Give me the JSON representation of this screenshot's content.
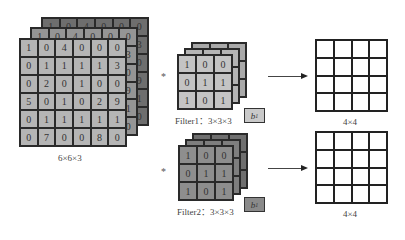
{
  "colors": {
    "input_back": "#6e6e6e",
    "input_mid": "#959595",
    "input_front": "#b5b5b5",
    "filter1_back": "#a9a9a9",
    "filter1_front": "#c4c4c4",
    "filter2_back": "#6f6f6f",
    "filter2_front": "#8e8e8e",
    "bias1_fill": "#c9c9c9",
    "bias2_fill": "#8a8a8a"
  },
  "input": {
    "label": "6×6×3",
    "back_layer_top_row": [
      "1",
      "0",
      "4",
      "0",
      "0",
      "0"
    ],
    "back_layer_right_col": [
      "0",
      "3",
      "0",
      "9",
      "1",
      "0"
    ],
    "mid_layer_top_row": [
      "1",
      "0",
      "4",
      "0",
      "0",
      "0"
    ],
    "mid_layer_right_col": [
      "0",
      "3",
      "0",
      "9",
      "1",
      "0"
    ],
    "front_layer": [
      [
        "1",
        "0",
        "4",
        "0",
        "0",
        "0"
      ],
      [
        "0",
        "1",
        "1",
        "1",
        "1",
        "3"
      ],
      [
        "0",
        "2",
        "0",
        "1",
        "0",
        "0"
      ],
      [
        "5",
        "0",
        "1",
        "0",
        "2",
        "9"
      ],
      [
        "0",
        "1",
        "1",
        "1",
        "1",
        "1"
      ],
      [
        "0",
        "7",
        "0",
        "0",
        "8",
        "0"
      ]
    ]
  },
  "operator": "*",
  "filters": [
    {
      "label": "Filter1：3×3×3",
      "bias": "b",
      "bias_sub": "1",
      "front_layer": [
        [
          "1",
          "0",
          "0"
        ],
        [
          "0",
          "1",
          "1"
        ],
        [
          "1",
          "0",
          "1"
        ]
      ]
    },
    {
      "label": "Filter2：3×3×3",
      "bias": "b",
      "bias_sub": "1",
      "front_layer": [
        [
          "1",
          "0",
          "0"
        ],
        [
          "0",
          "1",
          "1"
        ],
        [
          "1",
          "0",
          "1"
        ]
      ]
    }
  ],
  "outputs": [
    {
      "label": "4×4",
      "rows": 4,
      "cols": 4
    },
    {
      "label": "4×4",
      "rows": 4,
      "cols": 4
    }
  ]
}
